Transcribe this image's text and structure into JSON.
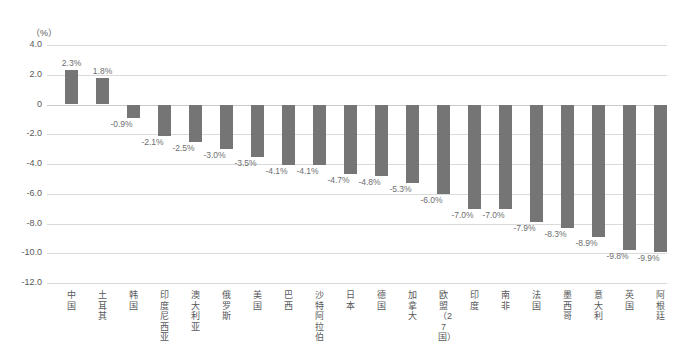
{
  "chart_data": {
    "type": "bar",
    "title": "",
    "subtitle": "",
    "xlabel": "",
    "ylabel": "",
    "unit_label": "（%）",
    "ylim": [
      -12.0,
      4.0
    ],
    "yticks": [
      "4.0",
      "2.0",
      "0",
      "-2.0",
      "-4.0",
      "-6.0",
      "-8.0",
      "-10.0",
      "-12.0"
    ],
    "ytick_values": [
      4.0,
      2.0,
      0,
      -2.0,
      -4.0,
      -6.0,
      -8.0,
      -10.0,
      -12.0
    ],
    "grid": true,
    "legend": "none",
    "bar_color": "#757575",
    "grid_color": "#d9dadb",
    "text_color": "#58595b",
    "categories": [
      "中国",
      "土耳其",
      "韩国",
      "印度尼西亚",
      "澳大利亚",
      "俄罗斯",
      "美国",
      "巴西",
      "沙特阿拉伯",
      "日本",
      "德国",
      "加拿大",
      "欧盟（27国）",
      "印度",
      "南非",
      "法国",
      "墨西哥",
      "意大利",
      "英国",
      "阿根廷"
    ],
    "values": [
      2.3,
      1.8,
      -0.9,
      -2.1,
      -2.5,
      -3.0,
      -3.5,
      -4.1,
      -4.1,
      -4.7,
      -4.8,
      -5.3,
      -6.0,
      -7.0,
      -7.0,
      -7.9,
      -8.3,
      -8.9,
      -9.8,
      -9.9
    ],
    "data_labels": [
      "2.3%",
      "1.8%",
      "-0.9%",
      "-2.1%",
      "-2.5%",
      "-3.0%",
      "-3.5%",
      "-4.1%",
      "-4.1%",
      "-4.7%",
      "-4.8%",
      "-5.3%",
      "-6.0%",
      "-7.0%",
      "-7.0%",
      "-7.9%",
      "-8.3%",
      "-8.9%",
      "-9.8%",
      "-9.9%"
    ]
  }
}
